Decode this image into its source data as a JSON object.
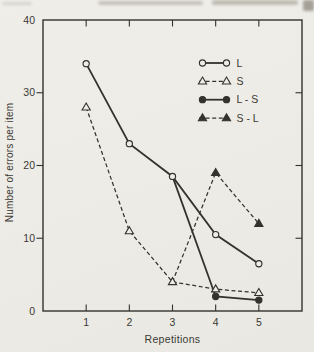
{
  "figure": {
    "background_color": "#edece7",
    "ink_color": "#34322d",
    "text_color": "#3b3933"
  },
  "chart_data": {
    "type": "line",
    "title": "",
    "xlabel": "Repetitions",
    "ylabel": "Number of errors per item",
    "xlim": [
      0,
      6
    ],
    "ylim": [
      0,
      40
    ],
    "x_ticks": [
      1,
      2,
      3,
      4,
      5
    ],
    "y_ticks": [
      0,
      10,
      20,
      30,
      40
    ],
    "y_ticks_right_unlabeled": [
      10,
      20,
      30
    ],
    "x_ticks_top_unlabeled": [
      1,
      2,
      3,
      4,
      5
    ],
    "grid": false,
    "legend_position": "upper-right-inside",
    "series": [
      {
        "name": "L",
        "line": "solid",
        "marker": "open-circle",
        "x": [
          1,
          2,
          3,
          4,
          5
        ],
        "values": [
          34,
          23,
          18.5,
          10.5,
          6.5
        ],
        "marker_on_first_point": true
      },
      {
        "name": "S",
        "line": "dashed",
        "marker": "open-triangle",
        "x": [
          1,
          2,
          3,
          4,
          5
        ],
        "values": [
          28,
          11,
          4,
          3,
          2.5
        ],
        "marker_on_first_point": true
      },
      {
        "name": "L - S",
        "line": "solid",
        "marker": "filled-circle",
        "x": [
          3,
          4,
          5
        ],
        "values": [
          18.5,
          2,
          1.5
        ],
        "marker_on_first_point": false
      },
      {
        "name": "S - L",
        "line": "dashed",
        "marker": "filled-triangle",
        "x": [
          3,
          4,
          5
        ],
        "values": [
          4,
          19,
          12
        ],
        "marker_on_first_point": false
      }
    ]
  }
}
